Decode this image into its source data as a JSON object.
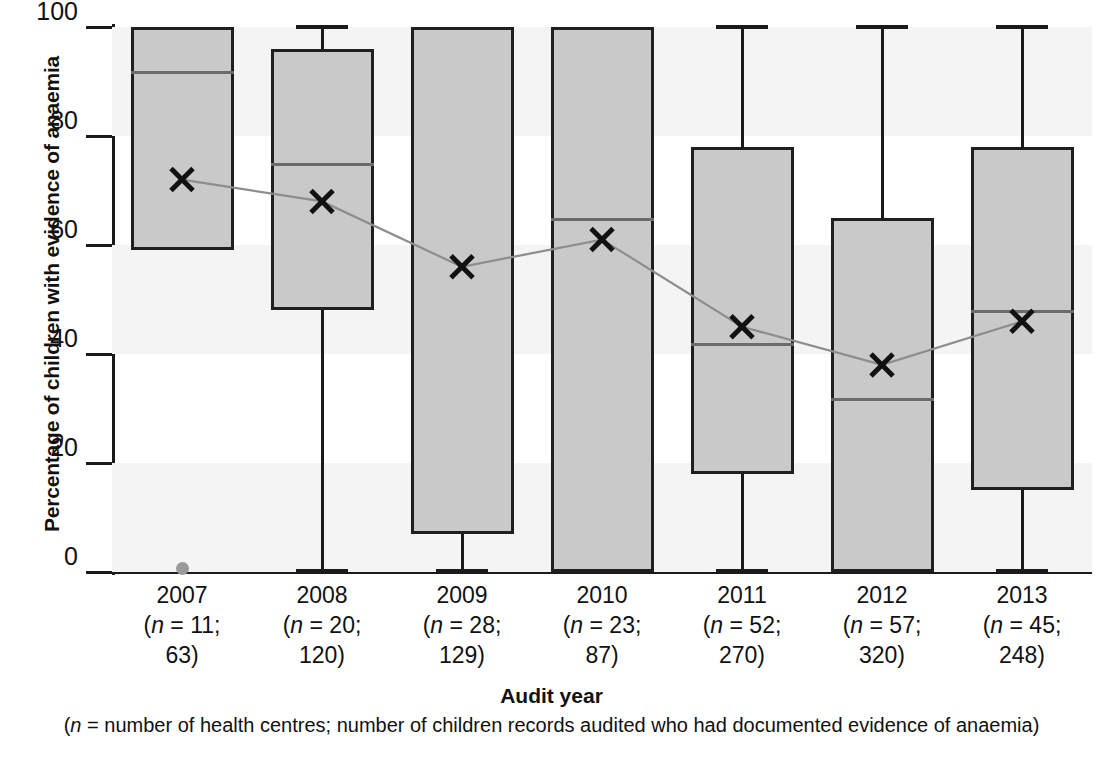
{
  "chart_data": {
    "type": "box",
    "title": "",
    "xlabel": "Audit year",
    "xlabel_note_prefix": "(",
    "xlabel_note_italic": "n",
    "xlabel_note_rest": " = number of health centres; number of children records audited who had documented evidence of anaemia)",
    "ylabel": "Percentage of children with evidence of anaemia",
    "ylim": [
      0,
      100
    ],
    "yticks": [
      0,
      20,
      40,
      60,
      80,
      100
    ],
    "ytick_labels": [
      "0",
      "20",
      "40",
      "60",
      "80",
      "100"
    ],
    "grid": false,
    "legend": "none",
    "categories": [
      "2007",
      "2008",
      "2009",
      "2010",
      "2011",
      "2012",
      "2013"
    ],
    "group_notes": [
      {
        "line1": "(n = 11;",
        "line2": "63)",
        "n_centres": 11,
        "n_records": 63
      },
      {
        "line1": "(n = 20;",
        "line2": "120)",
        "n_centres": 20,
        "n_records": 120
      },
      {
        "line1": "(n = 28;",
        "line2": "129)",
        "n_centres": 28,
        "n_records": 129
      },
      {
        "line1": "(n = 23;",
        "line2": "87)",
        "n_centres": 23,
        "n_records": 87
      },
      {
        "line1": "(n = 52;",
        "line2": "270)",
        "n_centres": 52,
        "n_records": 270
      },
      {
        "line1": "(n = 57;",
        "line2": "320)",
        "n_centres": 57,
        "n_records": 320
      },
      {
        "line1": "(n = 45;",
        "line2": "248)",
        "n_centres": 45,
        "n_records": 248
      }
    ],
    "boxes": [
      {
        "category": "2007",
        "whisker_low": 59,
        "q1": 59,
        "median": 92,
        "q3": 100,
        "whisker_high": 100,
        "mean": 72,
        "outliers": [
          0
        ]
      },
      {
        "category": "2008",
        "whisker_low": 0,
        "q1": 48,
        "median": 75,
        "q3": 96,
        "whisker_high": 100,
        "mean": 68,
        "outliers": []
      },
      {
        "category": "2009",
        "whisker_low": 0,
        "q1": 7,
        "median": 100,
        "q3": 100,
        "whisker_high": 100,
        "mean": 56,
        "outliers": []
      },
      {
        "category": "2010",
        "whisker_low": 0,
        "q1": 0,
        "median": 65,
        "q3": 100,
        "whisker_high": 100,
        "mean": 61,
        "outliers": []
      },
      {
        "category": "2011",
        "whisker_low": 0,
        "q1": 18,
        "median": 42,
        "q3": 78,
        "whisker_high": 100,
        "mean": 45,
        "outliers": []
      },
      {
        "category": "2012",
        "whisker_low": 0,
        "q1": 0,
        "median": 32,
        "q3": 65,
        "whisker_high": 100,
        "mean": 38,
        "outliers": []
      },
      {
        "category": "2013",
        "whisker_low": 0,
        "q1": 15,
        "median": 48,
        "q3": 78,
        "whisker_high": 100,
        "mean": 46,
        "outliers": []
      }
    ],
    "mean_series": {
      "name": "Mean",
      "marker": "x",
      "values": [
        72,
        68,
        56,
        61,
        45,
        38,
        46
      ]
    },
    "colors": {
      "box_fill": "#c9c9c9",
      "box_stroke": "#1f1f1f",
      "median_line": "#6b6b6b",
      "whisker": "#1a1a1a",
      "mean_marker": "#111111",
      "mean_line": "#8d8d8d",
      "outlier": "#9a9a9a",
      "band": "#f4f4f4",
      "axis": "#1a1a1a"
    }
  }
}
